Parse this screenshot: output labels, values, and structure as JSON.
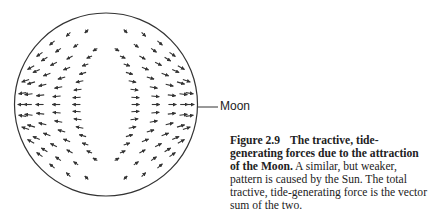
{
  "figure": {
    "label_moon": "Moon",
    "caption": {
      "number": "Figure 2.9",
      "title": "The tractive, tide-generating forces due to the attraction of the Moon.",
      "body": "A similar, but weaker, pattern is caused by the Sun. The total tractive, tide-generating force is the vector sum of the two."
    }
  },
  "diagram": {
    "circle": {
      "cx": 106,
      "cy": 104.5,
      "r": 91.5,
      "stroke": "#333333"
    },
    "moon_pointer": {
      "x1": 198,
      "x2": 218,
      "y": 107
    },
    "arrow_color": "#333333",
    "arrow_rows": [
      {
        "angle_deg": 0,
        "count": 5
      },
      {
        "angle_deg": 8,
        "count": 5
      },
      {
        "angle_deg": 17,
        "count": 5
      },
      {
        "angle_deg": 27,
        "count": 5
      },
      {
        "angle_deg": 38,
        "count": 5
      },
      {
        "angle_deg": 50,
        "count": 4
      },
      {
        "angle_deg": 63,
        "count": 3
      },
      {
        "angle_deg": 76,
        "count": 2
      }
    ]
  }
}
